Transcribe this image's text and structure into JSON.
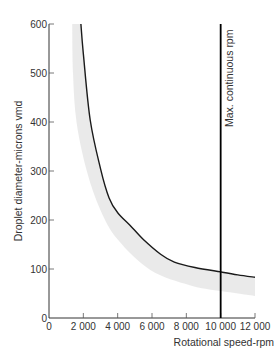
{
  "chart_data": {
    "type": "line",
    "title": "",
    "xlabel": "Rotational speed-rpm",
    "ylabel": "Droplet diameter-microns vmd",
    "xlim": [
      0,
      12000
    ],
    "ylim": [
      0,
      600
    ],
    "xticks": [
      0,
      2000,
      4000,
      6000,
      8000,
      10000,
      12000
    ],
    "xtick_labels": [
      "0",
      "2 000",
      "4 000",
      "6 000",
      "8 000",
      "10 000",
      "12 000"
    ],
    "yticks": [
      0,
      100,
      200,
      300,
      400,
      500,
      600
    ],
    "ytick_labels": [
      "0",
      "100",
      "200",
      "300",
      "400",
      "500",
      "600"
    ],
    "grid": false,
    "series": [
      {
        "name": "Droplet diameter curve",
        "color": "#1a1a1a",
        "x": [
          1860,
          2000,
          2400,
          3000,
          3500,
          4000,
          4700,
          5500,
          6500,
          7300,
          8500,
          10000,
          11000,
          12000
        ],
        "y": [
          600,
          540,
          404,
          305,
          245,
          215,
          190,
          160,
          130,
          114,
          103,
          94,
          88,
          83
        ]
      }
    ],
    "band": {
      "name": "Spread band",
      "color": "#e6e6e6",
      "upper": {
        "x": [
          1860,
          2400,
          3500,
          4700,
          6500,
          8500,
          10000,
          12000
        ],
        "y": [
          600,
          404,
          245,
          190,
          130,
          103,
          94,
          83
        ]
      },
      "lower": {
        "x": [
          1350,
          1400,
          1600,
          2200,
          3000,
          4000,
          5900,
          8200,
          10000,
          12000
        ],
        "y": [
          600,
          500,
          400,
          300,
          220,
          160,
          98,
          67,
          55,
          45
        ]
      }
    },
    "reference_lines": [
      {
        "orientation": "vertical",
        "x": 10000,
        "label": "Max. continuous rpm",
        "color": "#000000"
      }
    ]
  }
}
